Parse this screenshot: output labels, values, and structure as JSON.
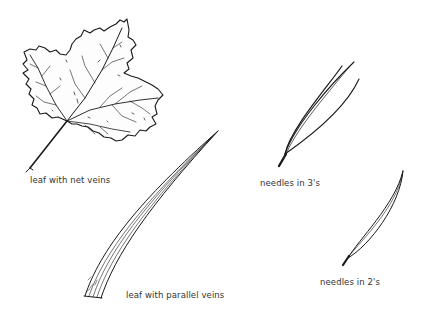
{
  "diagram": {
    "specimens": [
      {
        "id": "net-vein-leaf",
        "label": "leaf with net veins"
      },
      {
        "id": "needles-3",
        "label": "needles in 3's"
      },
      {
        "id": "parallel-vein-leaf",
        "label": "leaf with parallel veins"
      },
      {
        "id": "needles-2",
        "label": "needles in 2's"
      }
    ],
    "colors": {
      "ink": "#1a1a1a",
      "label": "#333333",
      "background": "#ffffff"
    }
  }
}
